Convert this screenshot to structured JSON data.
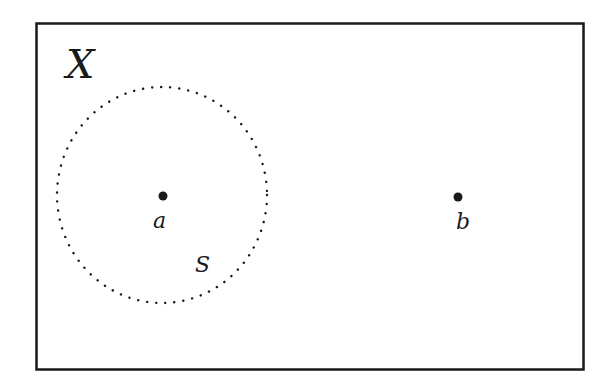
{
  "diagram": {
    "space_label": "X",
    "set_label": "S",
    "points": [
      {
        "label": "a",
        "x": 163,
        "y": 196
      },
      {
        "label": "b",
        "x": 458,
        "y": 197
      }
    ],
    "set_boundary": {
      "style": "dotted",
      "cx": 162,
      "cy": 195,
      "rx": 105,
      "ry": 108
    },
    "frame": {
      "x": 36,
      "y": 23,
      "width": 548,
      "height": 347
    },
    "colors": {
      "ink": "#1a1a1a",
      "background": "#ffffff"
    }
  }
}
